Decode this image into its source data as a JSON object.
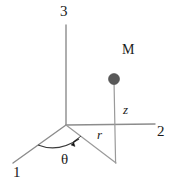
{
  "figure": {
    "kind": "cylindrical-coordinate-diagram",
    "background_color": "#ffffff",
    "line_color": "#8c8c8c",
    "label_color": "#1a1a1a",
    "marker_color": "#595959",
    "width": 181,
    "height": 185
  },
  "labels": {
    "axis_3": "3",
    "axis_2": "2",
    "axis_1": "1",
    "mass_point": "M",
    "height_coordinate": "z",
    "radial_coordinate": "r",
    "angle_coordinate": "θ"
  },
  "geometry": {
    "origin": {
      "x": 66,
      "y": 125
    },
    "axis_3_tip": {
      "x": 66,
      "y": 25
    },
    "axis_2_tip": {
      "x": 155,
      "y": 124
    },
    "axis_1_tip": {
      "x": 13,
      "y": 163
    },
    "projection_point": {
      "x": 116,
      "y": 163
    },
    "mass_position": {
      "x": 114,
      "y": 79
    },
    "mass_radius": 5.5,
    "arc_start": {
      "x": 38,
      "y": 145
    },
    "arc_end": {
      "x": 79,
      "y": 138
    }
  }
}
